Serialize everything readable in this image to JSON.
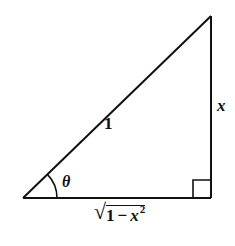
{
  "figure": {
    "type": "right-triangle",
    "stroke_color": "#111111",
    "background": "#ffffff",
    "vertices": {
      "bottom_left": [
        23,
        198
      ],
      "bottom_right": [
        211,
        198
      ],
      "top_right": [
        211,
        16
      ]
    },
    "right_angle_marker": {
      "corner": "bottom_right",
      "size": 18
    },
    "angle_arc": {
      "vertex": "bottom_left",
      "radius": 34
    }
  },
  "labels": {
    "hypotenuse": "1",
    "opposite": "x",
    "angle": "θ",
    "adjacent": {
      "sqrt_symbol": "√",
      "one": "1",
      "minus": "−",
      "var": "x",
      "exponent": "2"
    }
  }
}
